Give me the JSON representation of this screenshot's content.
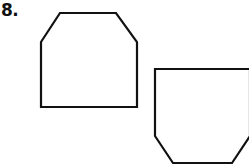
{
  "problem": {
    "number_label": "8."
  },
  "figures": [
    {
      "name": "upright-hexagon",
      "points": "60,13 116,13 137,42 137,107 41,107 41,42"
    },
    {
      "name": "inverted-hexagon",
      "points": "155,69 250,69 250,136 232,163 173,163 155,136"
    }
  ],
  "style": {
    "stroke": "#111111",
    "stroke_width": 2.2
  }
}
